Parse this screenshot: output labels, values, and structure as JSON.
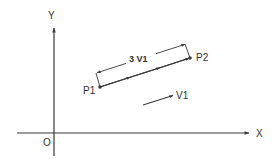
{
  "diagram": {
    "type": "vector-geometry",
    "colors": {
      "line": "#3a3a3a",
      "text": "#333333",
      "background": "#ffffff"
    },
    "axes": {
      "x_label": "X",
      "y_label": "Y",
      "origin_label": "O"
    },
    "points": {
      "p1_label": "P1",
      "p2_label": "P2"
    },
    "dimension": {
      "label": "3 V1"
    },
    "vector": {
      "label": "V1"
    }
  }
}
